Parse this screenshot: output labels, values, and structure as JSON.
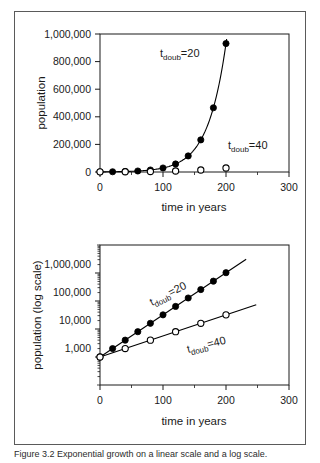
{
  "figure": {
    "caption": "Figure 3.2  Exponential growth on a linear scale and a log scale."
  },
  "chart_data": [
    {
      "id": "linear-panel",
      "type": "scatter",
      "title": "",
      "xlabel": "time in years",
      "ylabel": "population",
      "xlim": [
        0,
        300
      ],
      "ylim": [
        0,
        1100000
      ],
      "xticks": [
        0,
        100,
        200,
        300
      ],
      "xticklabels": [
        "0",
        "100",
        "200",
        "300"
      ],
      "yticks": [
        0,
        200000,
        400000,
        600000,
        800000,
        1000000
      ],
      "yticklabels": [
        "0",
        "200,000",
        "400,000",
        "600,000",
        "800,000",
        "1,000,000"
      ],
      "grid": false,
      "legend": "none",
      "series": [
        {
          "name": "t_doub=20",
          "marker": "filled-circle",
          "x": [
            0,
            20,
            40,
            60,
            80,
            100,
            120,
            140,
            160,
            180,
            200
          ],
          "values": [
            1000,
            2000,
            4000,
            8000,
            16000,
            32000,
            64000,
            128000,
            256000,
            512000,
            1024000
          ]
        },
        {
          "name": "t_doub=40",
          "marker": "open-circle",
          "x": [
            0,
            40,
            80,
            120,
            160,
            200
          ],
          "values": [
            1000,
            2000,
            4000,
            8000,
            16000,
            32000
          ]
        }
      ],
      "annotations": [
        {
          "text": "t",
          "sub": "doub",
          "suffix": "=20",
          "x": 95,
          "y": 830000,
          "rotation": 0
        },
        {
          "text": "t",
          "sub": "doub",
          "suffix": "=40",
          "x": 212,
          "y": 215000,
          "rotation": 0
        }
      ]
    },
    {
      "id": "log-panel",
      "type": "line",
      "title": "",
      "xlabel": "time in years",
      "ylabel": "population (log scale)",
      "xlim": [
        0,
        300
      ],
      "ylim": [
        100,
        10000000
      ],
      "yscale": "log",
      "xticks": [
        0,
        100,
        200,
        300
      ],
      "xticklabels": [
        "0",
        "100",
        "200",
        "300"
      ],
      "yticks": [
        1000,
        10000,
        100000,
        1000000
      ],
      "yticklabels": [
        "1,000",
        "10,000",
        "100,000",
        "1,000,000"
      ],
      "grid": false,
      "legend": "none",
      "series": [
        {
          "name": "t_doub=20",
          "marker": "filled-circle",
          "x": [
            0,
            20,
            40,
            60,
            80,
            100,
            120,
            140,
            160,
            180,
            200
          ],
          "values": [
            1000,
            2000,
            4000,
            8000,
            16000,
            32000,
            64000,
            128000,
            256000,
            512000,
            1024000
          ]
        },
        {
          "name": "t_doub=40",
          "marker": "open-circle",
          "x": [
            0,
            40,
            80,
            120,
            160,
            200
          ],
          "values": [
            1000,
            2000,
            4000,
            8000,
            16000,
            32000
          ]
        }
      ],
      "annotations": [
        {
          "text": "t",
          "sub": "doub",
          "suffix": "=20",
          "x": 85,
          "y": 130000,
          "rotation": -27
        },
        {
          "text": "t",
          "sub": "doub",
          "suffix": "=40",
          "x": 140,
          "y": 6800,
          "rotation": -14
        }
      ]
    }
  ],
  "colors": {
    "ink": "#1a1a1a",
    "frame": "#5a5a5a",
    "background": "#ffffff"
  }
}
